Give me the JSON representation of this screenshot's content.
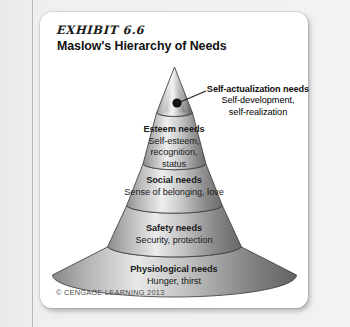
{
  "page": {
    "background_color": "#ececed",
    "card_color": "#ffffff"
  },
  "heading": {
    "exhibit_label": "EXHIBIT 6.6",
    "title": "Maslow's Hierarchy of Needs"
  },
  "callout": {
    "dot_label": "apex-marker-dot",
    "heading": "Self-actualization needs",
    "line1": "Self-development,",
    "line2": "self-realization"
  },
  "tiers": [
    {
      "id": "self-actualization",
      "heading": "Self-actualization needs",
      "sub_lines": [
        "Self-development,",
        "self-realization"
      ],
      "level": 5,
      "fill_light": "#f4f4f4",
      "fill_dark": "#6e6e6e"
    },
    {
      "id": "esteem",
      "heading": "Esteem needs",
      "sub_lines": [
        "Self-esteem,",
        "recognition,",
        "status"
      ],
      "level": 4,
      "fill_light": "#ededed",
      "fill_dark": "#8c8c8c"
    },
    {
      "id": "social",
      "heading": "Social needs",
      "sub_lines": [
        "Sense of belonging, love"
      ],
      "level": 3,
      "fill_light": "#e4e4e4",
      "fill_dark": "#7d7d7d"
    },
    {
      "id": "safety",
      "heading": "Safety needs",
      "sub_lines": [
        "Security, protection"
      ],
      "level": 2,
      "fill_light": "#dcdcdc",
      "fill_dark": "#6f6f6f"
    },
    {
      "id": "physiological",
      "heading": "Physiological needs",
      "sub_lines": [
        "Hunger, thirst"
      ],
      "level": 1,
      "fill_light": "#d8d8d8",
      "fill_dark": "#6a6a6a"
    }
  ],
  "tier_text": {
    "esteem_head": "Esteem needs",
    "esteem_l1": "Self-esteem,",
    "esteem_l2": "recognition,",
    "esteem_l3": "status",
    "social_head": "Social needs",
    "social_l1": "Sense of belonging, love",
    "safety_head": "Safety needs",
    "safety_l1": "Security, protection",
    "physio_head": "Physiological needs",
    "physio_l1": "Hunger, thirst"
  },
  "copyright": {
    "text": "© CENGAGE LEARNING 2013"
  }
}
